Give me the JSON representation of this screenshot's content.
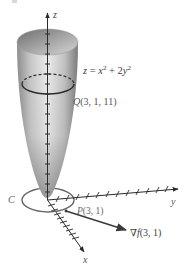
{
  "figure": {
    "type": "3d-surface-diagram",
    "surface": {
      "equation_parts": {
        "lhs": "z",
        "eq": " = ",
        "x": "x",
        "x_exp": "2",
        "plus": " + 2",
        "y": "y",
        "y_exp": "2"
      },
      "equation_text": "z = x² + 2y²",
      "fill_gradient": [
        "#8a8a8a",
        "#cfcfcf",
        "#f0f0f0",
        "#bdbdbd",
        "#7a7a7a"
      ]
    },
    "points": {
      "Q": {
        "label": "Q",
        "coords": "(3, 1, 11)"
      },
      "P": {
        "label": "P",
        "coords": "(3, 1)"
      }
    },
    "curve": {
      "label": "C"
    },
    "gradient_vector": {
      "symbol": "∇",
      "func": "f",
      "args": "(3, 1)"
    },
    "axes": {
      "x": {
        "label": "x"
      },
      "y": {
        "label": "y"
      },
      "z": {
        "label": "z"
      }
    },
    "colors": {
      "axis": "#2a2a2a",
      "curve": "#555555",
      "level_ring": "#333333",
      "text": "#444444"
    }
  }
}
